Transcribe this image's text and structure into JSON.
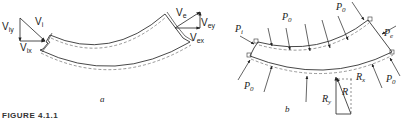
{
  "figure": {
    "caption": "FIGURE 4.1.1",
    "panel_a": {
      "sublabel": "a",
      "labels": {
        "v_iy": "V",
        "v_iy_sub": "iy",
        "v_i": "V",
        "v_i_sub": "i",
        "v_ix": "V",
        "v_ix_sub": "ix",
        "v_e": "V",
        "v_e_sub": "e",
        "v_ey": "V",
        "v_ey_sub": "ey",
        "v_ex": "V",
        "v_ex_sub": "ex"
      }
    },
    "panel_b": {
      "sublabel": "b",
      "labels": {
        "p_i": "P",
        "p_i_sub": "i",
        "p_e": "P",
        "p_e_sub": "e",
        "p0_top_left": "P",
        "p0_top_right": "P",
        "p0_bottom_left": "P",
        "p0_bottom_right": "P",
        "p0_sub": "0",
        "r_x": "R",
        "r_x_sub": "x",
        "r_y": "R",
        "r_y_sub": "y",
        "r": "R"
      }
    }
  }
}
